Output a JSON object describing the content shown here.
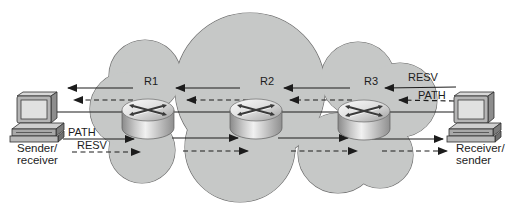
{
  "figure": {
    "cloud": {
      "name": "network-cloud"
    },
    "routers": [
      {
        "label": "R1"
      },
      {
        "label": "R2"
      },
      {
        "label": "R3"
      }
    ],
    "hosts": {
      "left": {
        "line1": "Sender/",
        "line2": "receiver"
      },
      "right": {
        "line1": "Receiver/",
        "line2": "sender"
      }
    },
    "messages": {
      "left": [
        {
          "label": "PATH",
          "style": "solid",
          "direction": "right"
        },
        {
          "label": "RESV",
          "style": "dashed",
          "direction": "right"
        }
      ],
      "right": [
        {
          "label": "RESV",
          "style": "solid",
          "direction": "left"
        },
        {
          "label": "PATH",
          "style": "dashed",
          "direction": "left"
        }
      ]
    },
    "colors": {
      "cloud_fill": "#c6c8c7",
      "cloud_stroke": "#707070",
      "line": "#1c1c1c",
      "text": "#1c1c1c"
    }
  }
}
